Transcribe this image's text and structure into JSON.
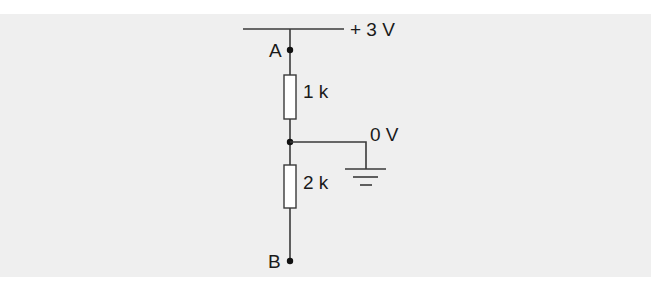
{
  "diagram": {
    "type": "voltage-divider-circuit",
    "colors": {
      "background": "#ffffff",
      "panel": "#efefef",
      "wire": "#3a3a3a",
      "text": "#1a1a1a"
    },
    "supply": {
      "label": "+ 3 V",
      "voltage": 3
    },
    "nodes": [
      {
        "id": "A",
        "label": "A"
      },
      {
        "id": "mid",
        "label": ""
      },
      {
        "id": "B",
        "label": "B"
      }
    ],
    "resistors": [
      {
        "id": "R1",
        "label": "1 k",
        "between": [
          "A",
          "mid"
        ]
      },
      {
        "id": "R2",
        "label": "2 k",
        "between": [
          "mid",
          "B"
        ]
      }
    ],
    "ground": {
      "label": "0 V",
      "connected_to": "mid"
    }
  }
}
